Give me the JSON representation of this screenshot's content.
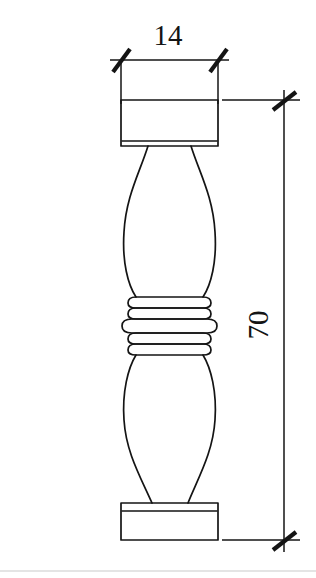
{
  "drawing": {
    "kind": "technical-drawing",
    "title": "Baluster / turned column elevation",
    "units_note": "",
    "line_color": "#141414",
    "background_color": "#ffffff",
    "rule_color": "#c9c9c9"
  },
  "dimensions": {
    "width": {
      "label": "14",
      "name": "overall-width",
      "orientation": "horizontal",
      "text_x": 168,
      "text_y": 45,
      "line_y": 60,
      "from_x": 121,
      "to_x": 218,
      "ext_top": 60,
      "ext_bottom": 104
    },
    "height": {
      "label": "70",
      "name": "overall-height",
      "orientation": "vertical",
      "text_x": 268,
      "text_y": 325,
      "line_x": 284,
      "from_y": 100,
      "to_y": 540,
      "ext_left_top": 222,
      "ext_left_bottom": 222,
      "ext_right": 300
    }
  },
  "object": {
    "name": "baluster",
    "top_cap": {
      "left": 121,
      "right": 218,
      "top": 100,
      "bottom": 146,
      "inner_line_y": 141
    },
    "base": {
      "left": 121,
      "right": 218,
      "top": 503,
      "bottom": 540,
      "inner_line_y": 511
    },
    "upper_bulge": {
      "widest_left": 123,
      "widest_right": 217,
      "widest_y": 252,
      "neck_top_y": 146,
      "neck_top_left": 148,
      "neck_top_right": 191
    },
    "lower_bulge": {
      "widest_left": 123,
      "widest_right": 217,
      "widest_y": 404,
      "neck_bottom_y": 503,
      "neck_bottom_left": 152,
      "neck_bottom_right": 188
    },
    "collar_rings": {
      "top_y": 297,
      "bottom_y": 350,
      "ring_count": 5,
      "narrow_left": 130,
      "narrow_right": 209,
      "wide_left": 122,
      "wide_right": 217,
      "line_ys": [
        300,
        307,
        316,
        327,
        336,
        343
      ]
    }
  },
  "page": {
    "rule_y": 571
  }
}
